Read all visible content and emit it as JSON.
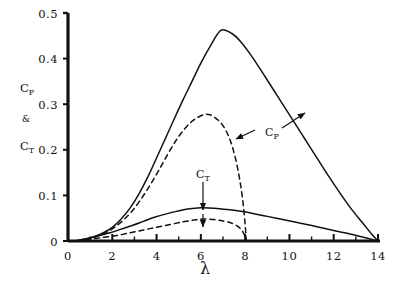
{
  "chart_data": {
    "type": "line",
    "title": "",
    "xlabel": "λ",
    "ylabel": "C_P & C_T",
    "ylabel_parts": [
      "C",
      "P",
      "&",
      "C",
      "T"
    ],
    "xlim": [
      0,
      14
    ],
    "ylim": [
      0,
      0.5
    ],
    "grid": false,
    "legend": "inline-annotations",
    "x_ticks": [
      0,
      2,
      4,
      6,
      8,
      10,
      12,
      14
    ],
    "x_tick_labels": [
      "0",
      "2",
      "4",
      "6",
      "8",
      "10",
      "12",
      "14"
    ],
    "x_minor_tick_step": 1,
    "y_ticks": [
      0,
      0.1,
      0.2,
      0.3,
      0.4,
      0.5
    ],
    "y_tick_labels": [
      "0",
      "0.1",
      "0.2",
      "0.3",
      "0.4",
      "0.5"
    ],
    "series": [
      {
        "name": "C_P solid",
        "style": "solid",
        "color": "#111111",
        "peak": {
          "x": 6.9,
          "y": 0.462
        },
        "points": [
          [
            0.3,
            0.0
          ],
          [
            0.8,
            0.004
          ],
          [
            1.2,
            0.01
          ],
          [
            1.6,
            0.018
          ],
          [
            2.0,
            0.03
          ],
          [
            2.4,
            0.048
          ],
          [
            2.8,
            0.072
          ],
          [
            3.2,
            0.103
          ],
          [
            3.6,
            0.14
          ],
          [
            4.0,
            0.182
          ],
          [
            4.4,
            0.225
          ],
          [
            4.8,
            0.268
          ],
          [
            5.2,
            0.31
          ],
          [
            5.6,
            0.35
          ],
          [
            6.0,
            0.39
          ],
          [
            6.4,
            0.425
          ],
          [
            6.9,
            0.462
          ],
          [
            7.4,
            0.455
          ],
          [
            7.8,
            0.437
          ],
          [
            8.3,
            0.405
          ],
          [
            8.8,
            0.368
          ],
          [
            9.3,
            0.33
          ],
          [
            9.8,
            0.292
          ],
          [
            10.3,
            0.254
          ],
          [
            10.8,
            0.216
          ],
          [
            11.3,
            0.178
          ],
          [
            11.8,
            0.14
          ],
          [
            12.3,
            0.104
          ],
          [
            12.8,
            0.07
          ],
          [
            13.3,
            0.04
          ],
          [
            13.7,
            0.016
          ],
          [
            14.0,
            0.0
          ]
        ]
      },
      {
        "name": "C_P dashed",
        "style": "dashed",
        "color": "#111111",
        "peak": {
          "x": 6.2,
          "y": 0.278
        },
        "points": [
          [
            0.4,
            0.0
          ],
          [
            0.9,
            0.004
          ],
          [
            1.3,
            0.01
          ],
          [
            1.7,
            0.018
          ],
          [
            2.1,
            0.03
          ],
          [
            2.5,
            0.046
          ],
          [
            2.9,
            0.066
          ],
          [
            3.3,
            0.092
          ],
          [
            3.7,
            0.122
          ],
          [
            4.1,
            0.155
          ],
          [
            4.5,
            0.19
          ],
          [
            4.9,
            0.222
          ],
          [
            5.3,
            0.248
          ],
          [
            5.7,
            0.266
          ],
          [
            6.2,
            0.278
          ],
          [
            6.6,
            0.272
          ],
          [
            7.0,
            0.253
          ],
          [
            7.3,
            0.224
          ],
          [
            7.55,
            0.184
          ],
          [
            7.75,
            0.136
          ],
          [
            7.9,
            0.086
          ],
          [
            8.0,
            0.036
          ],
          [
            8.05,
            0.0
          ]
        ]
      },
      {
        "name": "C_T solid",
        "style": "solid",
        "color": "#111111",
        "peak": {
          "x": 6.0,
          "y": 0.073
        },
        "points": [
          [
            0.3,
            0.0
          ],
          [
            0.9,
            0.006
          ],
          [
            1.4,
            0.012
          ],
          [
            1.9,
            0.018
          ],
          [
            2.4,
            0.026
          ],
          [
            2.9,
            0.034
          ],
          [
            3.4,
            0.043
          ],
          [
            3.9,
            0.052
          ],
          [
            4.4,
            0.059
          ],
          [
            4.9,
            0.065
          ],
          [
            5.4,
            0.07
          ],
          [
            6.0,
            0.073
          ],
          [
            6.6,
            0.072
          ],
          [
            7.2,
            0.069
          ],
          [
            7.8,
            0.065
          ],
          [
            8.4,
            0.06
          ],
          [
            9.0,
            0.054
          ],
          [
            9.7,
            0.047
          ],
          [
            10.4,
            0.04
          ],
          [
            11.1,
            0.033
          ],
          [
            11.8,
            0.025
          ],
          [
            12.5,
            0.018
          ],
          [
            13.2,
            0.01
          ],
          [
            13.7,
            0.004
          ],
          [
            14.0,
            0.0
          ]
        ]
      },
      {
        "name": "C_T dashed",
        "style": "dashed",
        "color": "#111111",
        "peak": {
          "x": 6.1,
          "y": 0.048
        },
        "points": [
          [
            0.4,
            0.0
          ],
          [
            1.0,
            0.004
          ],
          [
            1.6,
            0.008
          ],
          [
            2.2,
            0.012
          ],
          [
            2.8,
            0.018
          ],
          [
            3.4,
            0.024
          ],
          [
            4.0,
            0.03
          ],
          [
            4.6,
            0.036
          ],
          [
            5.2,
            0.042
          ],
          [
            5.7,
            0.046
          ],
          [
            6.1,
            0.048
          ],
          [
            6.6,
            0.047
          ],
          [
            7.0,
            0.044
          ],
          [
            7.4,
            0.039
          ],
          [
            7.7,
            0.031
          ],
          [
            7.9,
            0.02
          ],
          [
            8.0,
            0.008
          ],
          [
            8.05,
            0.0
          ]
        ]
      }
    ],
    "annotations": [
      {
        "name": "cp-annotation",
        "base": "C",
        "subscript": "P",
        "label_x": 265,
        "label_y": 136,
        "arrows": [
          {
            "from": [
              255,
              130
            ],
            "to": [
              236,
              139
            ]
          },
          {
            "from": [
              282,
              128
            ],
            "to": [
              305,
              113
            ]
          }
        ]
      },
      {
        "name": "ct-annotation",
        "base": "C",
        "subscript": "T",
        "label_x": 196,
        "label_y": 178,
        "arrows": [
          {
            "from": [
              203,
              182
            ],
            "to": [
              203,
              210
            ]
          },
          {
            "from": [
              203,
              214
            ],
            "to": [
              203,
              227
            ]
          }
        ]
      }
    ]
  },
  "axes": {
    "x_axis_name": "lambda-axis",
    "y_axis_name": "cp-ct-axis"
  }
}
